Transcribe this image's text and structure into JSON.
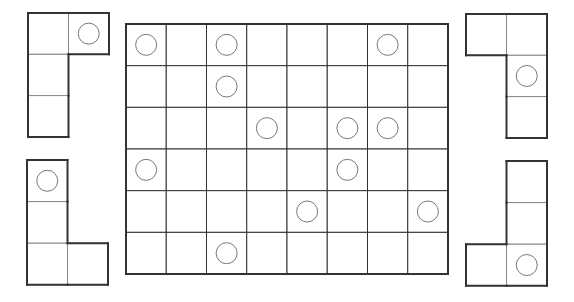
{
  "colors": {
    "background": "#ffffff",
    "line": "#333333",
    "circle": "#777777"
  },
  "board": {
    "cols": 8,
    "rows": 6,
    "x": 126,
    "y": 24,
    "cell_w": 40.25,
    "cell_h": 41.67,
    "circles": [
      [
        0,
        0
      ],
      [
        0,
        2
      ],
      [
        0,
        6
      ],
      [
        1,
        2
      ],
      [
        2,
        3
      ],
      [
        2,
        5
      ],
      [
        2,
        6
      ],
      [
        3,
        0
      ],
      [
        3,
        5
      ],
      [
        4,
        4
      ],
      [
        4,
        7
      ],
      [
        5,
        2
      ]
    ]
  },
  "pieces": [
    {
      "id": "piece-top-left",
      "x": 28,
      "y": 13,
      "cell_w": 40.5,
      "cell_h": 41.3,
      "cells": [
        [
          0,
          0
        ],
        [
          0,
          1
        ],
        [
          1,
          0
        ],
        [
          2,
          0
        ]
      ],
      "circles": [
        [
          0,
          1
        ]
      ]
    },
    {
      "id": "piece-bottom-left",
      "x": 27,
      "y": 160,
      "cell_w": 40.5,
      "cell_h": 41.6,
      "cells": [
        [
          0,
          0
        ],
        [
          1,
          0
        ],
        [
          2,
          0
        ],
        [
          2,
          1
        ]
      ],
      "circles": [
        [
          0,
          0
        ]
      ]
    },
    {
      "id": "piece-top-right",
      "x": 466,
      "y": 14,
      "cell_w": 40.5,
      "cell_h": 41.3,
      "cells": [
        [
          0,
          0
        ],
        [
          0,
          1
        ],
        [
          1,
          1
        ],
        [
          2,
          1
        ]
      ],
      "circles": [
        [
          1,
          1
        ]
      ]
    },
    {
      "id": "piece-bottom-right",
      "x": 466,
      "y": 161,
      "cell_w": 40.5,
      "cell_h": 41.6,
      "cells": [
        [
          0,
          1
        ],
        [
          1,
          1
        ],
        [
          2,
          0
        ],
        [
          2,
          1
        ]
      ],
      "circles": [
        [
          2,
          1
        ]
      ]
    }
  ]
}
